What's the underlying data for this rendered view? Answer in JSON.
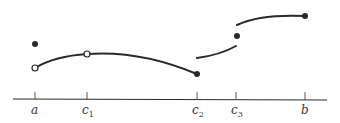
{
  "diagram": {
    "type": "piecewise-function-graph",
    "axis": {
      "ticks": [
        {
          "id": "a",
          "label": "a",
          "sub": "",
          "x": 35
        },
        {
          "id": "c1",
          "label": "c",
          "sub": "1",
          "x": 87
        },
        {
          "id": "c2",
          "label": "c",
          "sub": "2",
          "x": 197
        },
        {
          "id": "c3",
          "label": "c",
          "sub": "3",
          "x": 236
        },
        {
          "id": "b",
          "label": "b",
          "sub": "",
          "x": 305
        }
      ]
    },
    "points": [
      {
        "name": "isolated-point-at-a",
        "type": "filled",
        "x": 35,
        "y": 44
      },
      {
        "name": "open-point-at-a",
        "type": "open",
        "x": 35,
        "y": 68
      },
      {
        "name": "open-point-at-c1",
        "type": "open",
        "x": 87,
        "y": 54
      },
      {
        "name": "endpoint-at-c2",
        "type": "filled",
        "x": 197,
        "y": 74
      },
      {
        "name": "isolated-point-at-c3",
        "type": "filled",
        "x": 237,
        "y": 36
      },
      {
        "name": "endpoint-at-b",
        "type": "filled",
        "x": 305,
        "y": 16
      }
    ],
    "colors": {
      "stroke": "#2a2a2a",
      "background": "#ffffff"
    }
  }
}
